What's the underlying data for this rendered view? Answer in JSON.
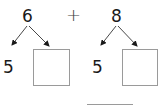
{
  "problem": {
    "left": {
      "top_number": "6",
      "known_part": "5",
      "unknown_part": ""
    },
    "operator": "+",
    "right": {
      "top_number": "8",
      "known_part": "5",
      "unknown_part": ""
    },
    "answer": ""
  },
  "colors": {
    "text": "#1a1a1a",
    "box_border": "#9a9a9a",
    "line": "#9a9a9a"
  }
}
